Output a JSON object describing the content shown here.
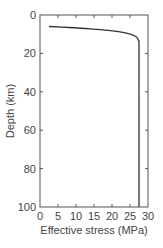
{
  "chart_data": {
    "type": "line",
    "title": "",
    "xlabel": "Effective stress (MPa)",
    "ylabel": "Depth (km)",
    "xlim": [
      0,
      30
    ],
    "ylim": [
      0,
      100
    ],
    "y_inverted": true,
    "grid": false,
    "legend": null,
    "x_ticks": [
      0,
      5,
      10,
      15,
      20,
      25,
      30
    ],
    "y_ticks": [
      0,
      20,
      40,
      60,
      80,
      100
    ],
    "series": [
      {
        "name": "Effective stress profile",
        "color": "#333333",
        "points": [
          {
            "x": 2.5,
            "y": 6.0
          },
          {
            "x": 8.0,
            "y": 6.5
          },
          {
            "x": 14.0,
            "y": 7.2
          },
          {
            "x": 19.0,
            "y": 8.0
          },
          {
            "x": 23.0,
            "y": 9.0
          },
          {
            "x": 25.5,
            "y": 10.2
          },
          {
            "x": 26.8,
            "y": 11.5
          },
          {
            "x": 27.3,
            "y": 13.0
          },
          {
            "x": 27.5,
            "y": 16.0
          },
          {
            "x": 27.5,
            "y": 40.0
          },
          {
            "x": 27.5,
            "y": 70.0
          },
          {
            "x": 27.5,
            "y": 100.0
          }
        ]
      }
    ]
  },
  "colors": {
    "axis": "#555555",
    "text": "#444444",
    "line": "#333333",
    "background": "#ffffff"
  }
}
